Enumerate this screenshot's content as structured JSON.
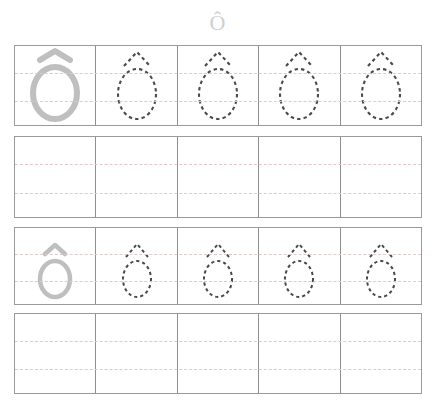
{
  "worksheet": {
    "title_letter": "Ô",
    "letter_name": "O-circumflex",
    "colors": {
      "grid_border": "#9a9a9a",
      "cell_divider": "#8f8f8f",
      "guide_line": "#e0c9c9",
      "model_letter": "#bfbfbf",
      "trace_letter": "#4a4a4a",
      "title_letter": "#cfcfcf",
      "page_background": "#ffffff"
    },
    "rows": [
      {
        "index": 1,
        "type": "trace-row",
        "size": "large",
        "cells": [
          {
            "kind": "model",
            "letter": "Ô"
          },
          {
            "kind": "trace",
            "letter": "Ô"
          },
          {
            "kind": "trace",
            "letter": "Ô"
          },
          {
            "kind": "trace",
            "letter": "Ô"
          },
          {
            "kind": "trace",
            "letter": "Ô"
          }
        ]
      },
      {
        "index": 2,
        "type": "practice-row",
        "size": "large",
        "cells": [
          {
            "kind": "blank",
            "letter": ""
          },
          {
            "kind": "blank",
            "letter": ""
          },
          {
            "kind": "blank",
            "letter": ""
          },
          {
            "kind": "blank",
            "letter": ""
          },
          {
            "kind": "blank",
            "letter": ""
          }
        ]
      },
      {
        "index": 3,
        "type": "trace-row",
        "size": "small",
        "cells": [
          {
            "kind": "model",
            "letter": "Ô"
          },
          {
            "kind": "trace",
            "letter": "Ô"
          },
          {
            "kind": "trace",
            "letter": "Ô"
          },
          {
            "kind": "trace",
            "letter": "Ô"
          },
          {
            "kind": "trace",
            "letter": "Ô"
          }
        ]
      },
      {
        "index": 4,
        "type": "practice-row",
        "size": "small",
        "cells": [
          {
            "kind": "blank",
            "letter": ""
          },
          {
            "kind": "blank",
            "letter": ""
          },
          {
            "kind": "blank",
            "letter": ""
          },
          {
            "kind": "blank",
            "letter": ""
          },
          {
            "kind": "blank",
            "letter": ""
          }
        ]
      }
    ]
  }
}
